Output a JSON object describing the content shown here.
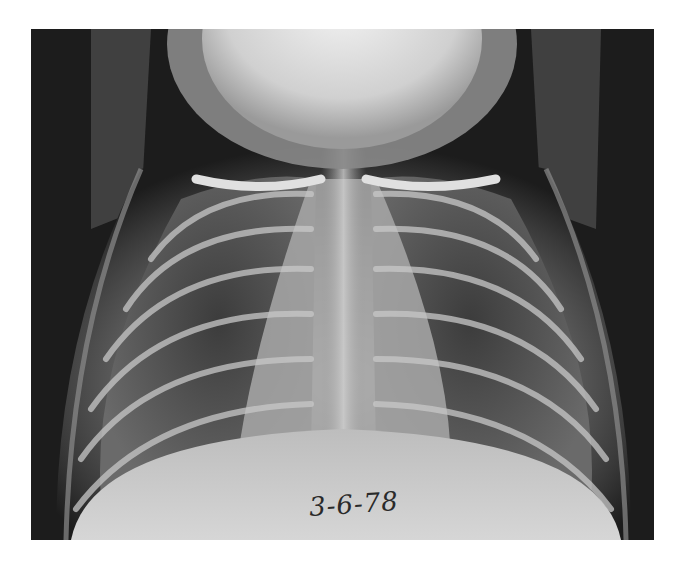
{
  "image": {
    "type": "chest radiograph (frontal view)",
    "annotation": {
      "handwritten_date": "3-6-78"
    },
    "colors": {
      "background": "#ffffff",
      "film_dark": "#1c1c1c",
      "bone_bright": "#e6e6e6",
      "soft_tissue": "#9a9a9a"
    }
  }
}
